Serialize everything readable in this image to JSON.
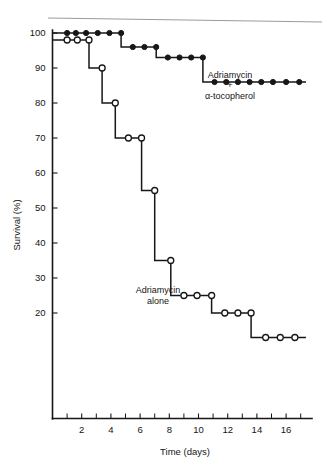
{
  "artifact": {
    "top_text": ""
  },
  "chart_data": {
    "type": "line",
    "subtype": "kaplan-meier-step",
    "title": "",
    "xlabel": "Time (days)",
    "ylabel": "Survival (%)",
    "xlim": [
      0,
      17.5
    ],
    "ylim": [
      8,
      104
    ],
    "grid": false,
    "legend_position": "inline-annotation",
    "x_ticks_major": [
      2,
      4,
      6,
      8,
      10,
      12,
      14,
      16
    ],
    "x_ticks_minor": [
      1,
      3,
      5,
      7,
      9,
      11,
      13,
      15,
      17
    ],
    "x_tick_labels": [
      "2",
      "4",
      "6",
      "8",
      "10",
      "12",
      "14",
      "16"
    ],
    "y_ticks": [
      100,
      90,
      80,
      70,
      60,
      50,
      40,
      30,
      20
    ],
    "y_tick_labels": [
      "100",
      "90",
      "80",
      "70",
      "60",
      "50",
      "40",
      "30",
      "20"
    ],
    "series": [
      {
        "name": "Adriamycin + α-tocopherol",
        "label_lines": [
          "Adriamycin",
          "+",
          "α-tocopherol"
        ],
        "marker": "filled-circle",
        "x": [
          1,
          1.6,
          2.3,
          3.1,
          3.9,
          4.7,
          5.5,
          6.3,
          7.1,
          7.9,
          8.7,
          9.5,
          10.3,
          11.1,
          11.9,
          12.7,
          13.5,
          14.3,
          15.1,
          16.0,
          16.9
        ],
        "values": [
          100,
          100,
          100,
          100,
          100,
          100,
          96,
          96,
          96,
          93,
          93,
          93,
          93,
          86,
          86,
          86,
          86,
          86,
          86,
          86,
          86
        ]
      },
      {
        "name": "Adriamycin alone",
        "label_lines": [
          "Adriamycin",
          "alone"
        ],
        "marker": "open-circle",
        "x": [
          1.0,
          1.7,
          2.5,
          3.4,
          4.3,
          5.2,
          6.1,
          7.0,
          8.1,
          9.0,
          9.9,
          10.9,
          11.8,
          12.7,
          13.6,
          14.6,
          15.6,
          16.6
        ],
        "values": [
          98,
          98,
          98,
          90,
          80,
          70,
          70,
          55,
          35,
          25,
          25,
          25,
          20,
          20,
          20,
          13,
          13,
          13
        ]
      }
    ],
    "annotations": [
      {
        "text": "Adriamycin",
        "x_px": 230,
        "y_px": 78
      },
      {
        "text": "+",
        "x_px": 230,
        "y_px": 88
      },
      {
        "text": "α-tocopherol",
        "x_px": 230,
        "y_px": 99
      },
      {
        "text": "Adriamycin",
        "x_px": 158,
        "y_px": 293
      },
      {
        "text": "alone",
        "x_px": 158,
        "y_px": 304
      }
    ]
  }
}
